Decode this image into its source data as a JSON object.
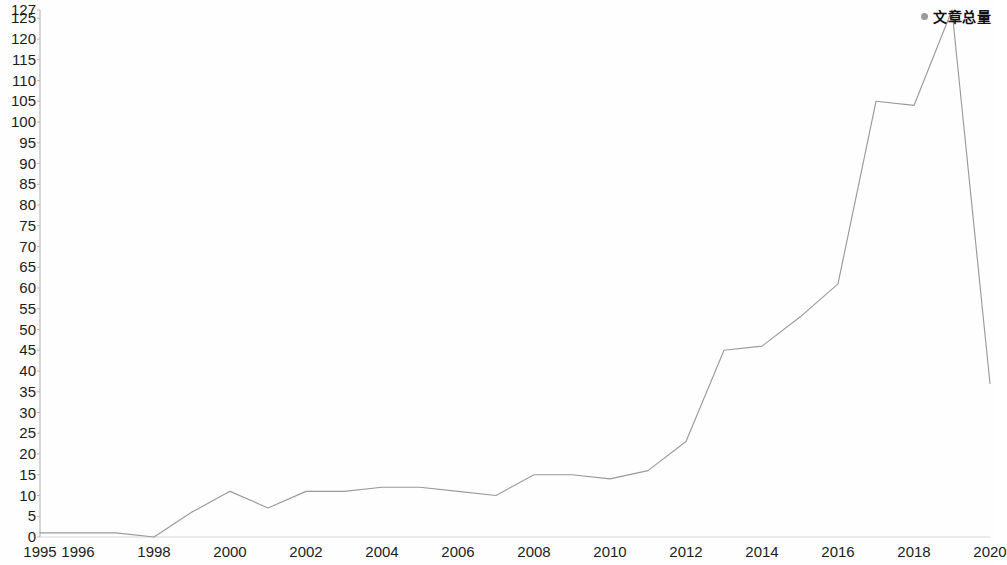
{
  "chart_data": {
    "type": "line",
    "title": "",
    "subtitle": "",
    "xlabel": "",
    "ylabel": "",
    "xlim": [
      1995,
      2020
    ],
    "ylim": [
      0,
      127
    ],
    "grid": false,
    "legend_position": "top-right",
    "legend": [
      "文章总量"
    ],
    "x_tick_labels": [
      "1995",
      "1996",
      "1998",
      "2000",
      "2002",
      "2004",
      "2006",
      "2008",
      "2010",
      "2012",
      "2014",
      "2016",
      "2018",
      "2020"
    ],
    "x_tick_values": [
      1995,
      1996,
      1998,
      2000,
      2002,
      2004,
      2006,
      2008,
      2010,
      2012,
      2014,
      2016,
      2018,
      2020
    ],
    "y_tick_labels": [
      "0",
      "5",
      "10",
      "15",
      "20",
      "25",
      "30",
      "35",
      "40",
      "45",
      "50",
      "55",
      "60",
      "65",
      "70",
      "75",
      "80",
      "85",
      "90",
      "95",
      "100",
      "105",
      "110",
      "115",
      "120",
      "125",
      "127"
    ],
    "y_tick_values": [
      0,
      5,
      10,
      15,
      20,
      25,
      30,
      35,
      40,
      45,
      50,
      55,
      60,
      65,
      70,
      75,
      80,
      85,
      90,
      95,
      100,
      105,
      110,
      115,
      120,
      125,
      127
    ],
    "x": [
      1995,
      1996,
      1997,
      1998,
      1999,
      2000,
      2001,
      2002,
      2003,
      2004,
      2005,
      2006,
      2007,
      2008,
      2009,
      2010,
      2011,
      2012,
      2013,
      2014,
      2015,
      2016,
      2017,
      2018,
      2019,
      2020
    ],
    "series": [
      {
        "name": "文章总量",
        "color": "#9a9a9a",
        "values": [
          1,
          1,
          1,
          0,
          6,
          11,
          7,
          11,
          11,
          12,
          12,
          11,
          10,
          15,
          15,
          14,
          16,
          23,
          45,
          46,
          53,
          61,
          105,
          104,
          127,
          37
        ]
      }
    ]
  },
  "legend": {
    "marker": "dot-marker",
    "label": "文章总量"
  },
  "axes": {
    "y_axis_name": "y-axis",
    "x_axis_name": "x-axis"
  }
}
